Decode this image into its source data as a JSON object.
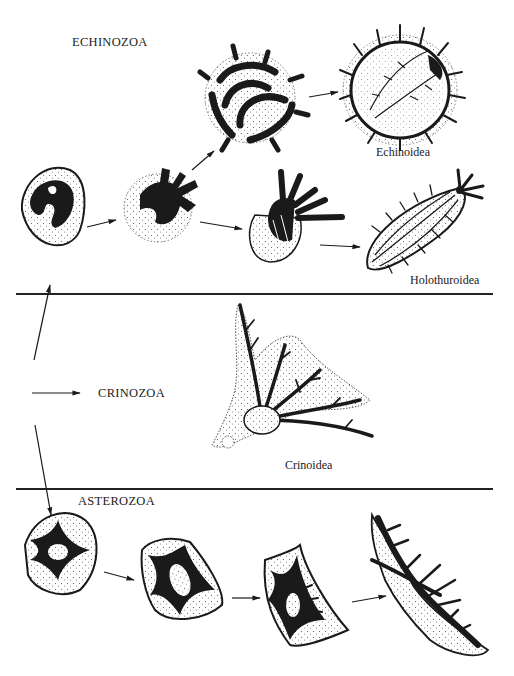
{
  "figure": {
    "groups": [
      {
        "id": "echinozoa",
        "label": "ECHINOZOA"
      },
      {
        "id": "crinozoa",
        "label": "CRINOZOA"
      },
      {
        "id": "asterozoa",
        "label": "ASTEROZOA"
      }
    ],
    "classes": [
      {
        "id": "echinoidea",
        "label": "Echinoidea",
        "group": "echinozoa"
      },
      {
        "id": "holothuroidea",
        "label": "Holothuroidea",
        "group": "echinozoa"
      },
      {
        "id": "crinoidea",
        "label": "Crinoidea",
        "group": "crinozoa"
      }
    ],
    "colors": {
      "ink": "#1a1a1a",
      "stipple": "#555555",
      "background": "#ffffff"
    },
    "sections": {
      "divider_1_y": 294,
      "divider_2_y": 489
    }
  }
}
